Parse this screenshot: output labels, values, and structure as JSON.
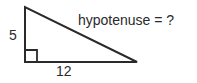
{
  "diagram": {
    "type": "right-triangle",
    "labels": {
      "vertical_side": "5",
      "horizontal_side": "12",
      "hypotenuse": "hypotenuse = ?"
    },
    "vertices": {
      "top": [
        25,
        7
      ],
      "right_angle": [
        25,
        62
      ],
      "bottom_right": [
        137,
        62
      ]
    },
    "right_angle_marker_size": 12,
    "stroke_color": "#2a2a2a",
    "background_color": "#ffffff"
  }
}
